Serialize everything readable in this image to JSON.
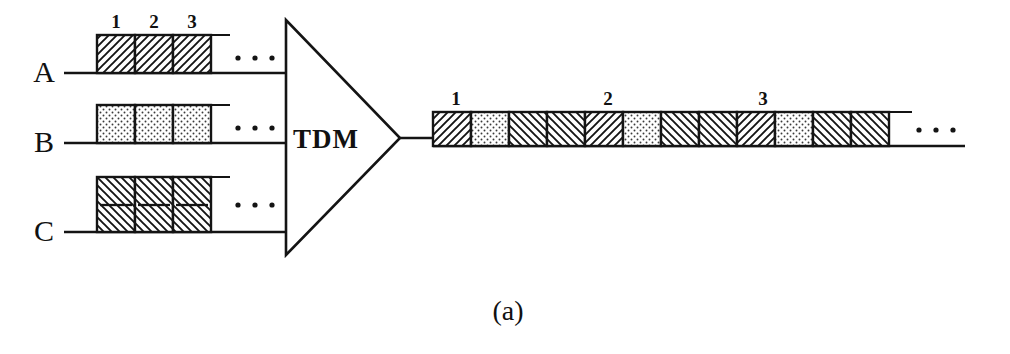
{
  "figure": {
    "caption": "(a)",
    "multiplexer": {
      "label": "TDM",
      "shape": "triangle"
    },
    "ellipsis_glyph": "•",
    "colors": {
      "ink": "#141414",
      "paper": "#ffffff",
      "hatch": "#141414",
      "stipple": "#5a5a5a"
    }
  },
  "inputs": [
    {
      "name": "A",
      "label": "A",
      "pattern": "forward-hatch",
      "slot_labels": [
        "1",
        "2",
        "3"
      ],
      "slot_count": 3,
      "double_height": false,
      "trailing_dots": 3
    },
    {
      "name": "B",
      "label": "B",
      "pattern": "stipple-dots",
      "slot_labels": [
        "",
        "",
        ""
      ],
      "slot_count": 3,
      "double_height": false,
      "trailing_dots": 3
    },
    {
      "name": "C",
      "label": "C",
      "pattern": "back-hatch",
      "slot_labels": [
        "",
        "",
        ""
      ],
      "slot_count": 3,
      "double_height": true,
      "trailing_dots": 3
    }
  ],
  "output": {
    "frame_labels": [
      "1",
      "2",
      "3"
    ],
    "trailing_dots": 3,
    "cells": [
      {
        "source": "A",
        "pattern": "forward-hatch"
      },
      {
        "source": "B",
        "pattern": "stipple-dots"
      },
      {
        "source": "C",
        "pattern": "back-hatch"
      },
      {
        "source": "C",
        "pattern": "back-hatch"
      },
      {
        "source": "A",
        "pattern": "forward-hatch"
      },
      {
        "source": "B",
        "pattern": "stipple-dots"
      },
      {
        "source": "C",
        "pattern": "back-hatch"
      },
      {
        "source": "C",
        "pattern": "back-hatch"
      },
      {
        "source": "A",
        "pattern": "forward-hatch"
      },
      {
        "source": "B",
        "pattern": "stipple-dots"
      },
      {
        "source": "C",
        "pattern": "back-hatch"
      },
      {
        "source": "C",
        "pattern": "back-hatch"
      }
    ]
  }
}
